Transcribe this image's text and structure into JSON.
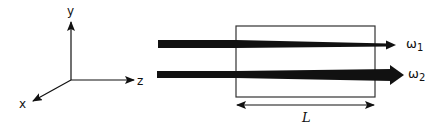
{
  "diagram": {
    "title": "",
    "axes": {
      "x_label": "x",
      "y_label": "y",
      "z_label": "z"
    },
    "medium": {
      "length_label": "L"
    },
    "beams": [
      {
        "id": "beam-1",
        "symbol": "ω",
        "subscript": "1",
        "label": "ω1",
        "behavior": "thin, constant width"
      },
      {
        "id": "beam-2",
        "symbol": "ω",
        "subscript": "2",
        "label": "ω2",
        "behavior": "grows wider through medium (amplified)"
      }
    ],
    "colors": {
      "ink": "#111111",
      "box_stroke": "#333333",
      "background": "#ffffff"
    }
  }
}
